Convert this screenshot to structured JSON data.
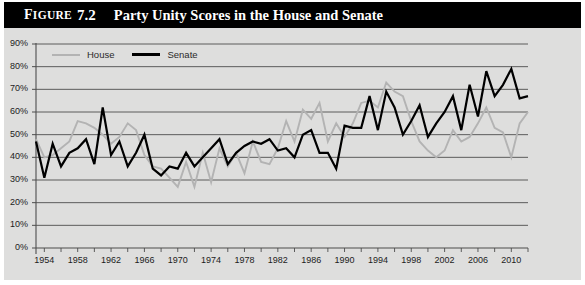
{
  "figure": {
    "label": "FIGURE",
    "label_caps": "IGURE",
    "label_first": "F",
    "number": "7.2",
    "title": "Party Unity Scores in the House and Senate"
  },
  "legend": {
    "position": "top-left",
    "entries": [
      {
        "name": "House",
        "color": "#b3b3b3",
        "icon": "line-swatch-icon"
      },
      {
        "name": "Senate",
        "color": "#000000",
        "icon": "line-swatch-icon"
      }
    ]
  },
  "colors": {
    "title_bar_bg": "#000000",
    "title_text": "#ffffff",
    "panel_bg": "#dededd",
    "gridline": "#4d4d4d",
    "axis": "#4d4d4d",
    "house": "#b3b3b3",
    "senate": "#000000"
  },
  "chart_data": {
    "type": "line",
    "title": "Party Unity Scores in the House and Senate",
    "xlabel": "",
    "ylabel": "",
    "xlim": [
      1953,
      2012
    ],
    "ylim": [
      0,
      90
    ],
    "grid": true,
    "ytick_labels": [
      "0%",
      "10%",
      "20%",
      "30%",
      "40%",
      "50%",
      "60%",
      "70%",
      "80%",
      "90%"
    ],
    "ytick_values": [
      0,
      10,
      20,
      30,
      40,
      50,
      60,
      70,
      80,
      90
    ],
    "xtick_labels": [
      "1954",
      "1958",
      "1962",
      "1966",
      "1970",
      "1974",
      "1978",
      "1982",
      "1986",
      "1990",
      "1994",
      "1998",
      "2002",
      "2006",
      "2010"
    ],
    "xtick_values": [
      1954,
      1958,
      1962,
      1966,
      1970,
      1974,
      1978,
      1982,
      1986,
      1990,
      1994,
      1998,
      2002,
      2006,
      2010
    ],
    "xtick_minor_step": 2,
    "x": [
      1953,
      1954,
      1955,
      1956,
      1957,
      1958,
      1959,
      1960,
      1961,
      1962,
      1963,
      1964,
      1965,
      1966,
      1967,
      1968,
      1969,
      1970,
      1971,
      1972,
      1973,
      1974,
      1975,
      1976,
      1977,
      1978,
      1979,
      1980,
      1981,
      1982,
      1983,
      1984,
      1985,
      1986,
      1987,
      1988,
      1989,
      1990,
      1991,
      1992,
      1993,
      1994,
      1995,
      1996,
      1997,
      1998,
      1999,
      2000,
      2001,
      2002,
      2003,
      2004,
      2005,
      2006,
      2007,
      2008,
      2009,
      2010,
      2011,
      2012
    ],
    "series": [
      {
        "name": "House",
        "color": "#b3b3b3",
        "values": [
          48,
          40,
          41,
          44,
          47,
          56,
          55,
          53,
          50,
          46,
          49,
          55,
          52,
          41,
          36,
          35,
          31,
          27,
          38,
          27,
          42,
          29,
          44,
          36,
          42,
          33,
          47,
          38,
          37,
          44,
          56,
          47,
          61,
          57,
          64,
          47,
          55,
          49,
          55,
          64,
          65,
          62,
          73,
          69,
          67,
          56,
          47,
          43,
          40,
          43,
          52,
          47,
          49,
          55,
          62,
          53,
          51,
          40,
          55,
          60
        ]
      },
      {
        "name": "Senate",
        "color": "#000000",
        "values": [
          47,
          31,
          46,
          36,
          42,
          44,
          48,
          37,
          62,
          41,
          47,
          36,
          42,
          50,
          35,
          32,
          36,
          35,
          42,
          36,
          40,
          44,
          48,
          37,
          42,
          45,
          47,
          46,
          48,
          43,
          44,
          40,
          50,
          52,
          42,
          42,
          35,
          54,
          53,
          53,
          67,
          52,
          69,
          62,
          50,
          56,
          63,
          49,
          55,
          60,
          67,
          52,
          72,
          58,
          78,
          67,
          72,
          79,
          66,
          67
        ]
      }
    ]
  }
}
